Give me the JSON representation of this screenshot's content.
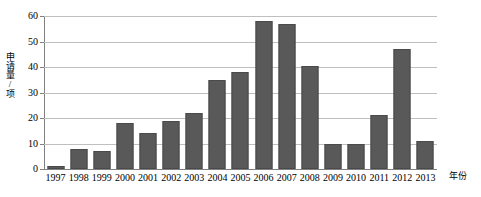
{
  "chart_data": {
    "type": "bar",
    "title": "",
    "subtitle": "",
    "xlabel": "年份",
    "ylabel": "申请量/项",
    "categories": [
      "1997",
      "1998",
      "1999",
      "2000",
      "2001",
      "2002",
      "2003",
      "2004",
      "2005",
      "2006",
      "2007",
      "2008",
      "2009",
      "2010",
      "2011",
      "2012",
      "2013"
    ],
    "values": [
      1,
      8,
      7,
      18,
      14,
      19,
      22,
      35,
      38,
      58,
      57,
      40.5,
      10,
      10,
      21,
      47,
      11
    ],
    "ylim": [
      0,
      60
    ],
    "yticks": [
      0,
      10,
      20,
      30,
      40,
      50,
      60
    ],
    "ytick_labels": [
      "0",
      "10",
      "20",
      "30",
      "40",
      "50",
      "60"
    ],
    "grid": true,
    "grid_axis": "y",
    "legend": false,
    "legend_position": "none",
    "series": [
      {
        "name": "申请量",
        "color": "#595959",
        "values": [
          1,
          8,
          7,
          18,
          14,
          19,
          22,
          35,
          38,
          58,
          57,
          40.5,
          10,
          10,
          21,
          47,
          11
        ]
      }
    ],
    "colors": {
      "bar_fill": "#595959",
      "bar_border": "#4a4a4a",
      "gridline": "#bfbfbf",
      "axis": "#808080",
      "text": "#000000",
      "background": "#ffffff"
    }
  }
}
